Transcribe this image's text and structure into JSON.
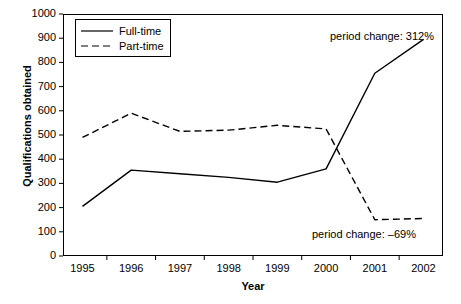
{
  "chart_data": {
    "type": "line",
    "title": "",
    "xlabel": "Year",
    "ylabel": "Qualifications obtained",
    "categories": [
      "1995",
      "1996",
      "1997",
      "1998",
      "1999",
      "2000",
      "2001",
      "2002"
    ],
    "x": [
      1995,
      1996,
      1997,
      1998,
      1999,
      2000,
      2001,
      2002
    ],
    "xlim": [
      1994.6,
      2002.4
    ],
    "ylim": [
      0,
      1000
    ],
    "yticks": [
      0,
      100,
      200,
      300,
      400,
      500,
      600,
      700,
      800,
      900,
      1000
    ],
    "ytick_labels": [
      "0",
      "100",
      "200",
      "300",
      "400",
      "500",
      "600",
      "700",
      "800",
      "900",
      "1000"
    ],
    "grid": false,
    "legend_position": "top-left",
    "series": [
      {
        "name": "Full-time",
        "style": "solid",
        "color": "#000000",
        "values": [
          205,
          355,
          340,
          325,
          305,
          360,
          755,
          895
        ]
      },
      {
        "name": "Part-time",
        "style": "dashed",
        "color": "#000000",
        "values": [
          490,
          590,
          515,
          520,
          540,
          525,
          150,
          155
        ]
      }
    ],
    "annotations": [
      {
        "text": "period change: 312%",
        "series": "Full-time"
      },
      {
        "text": "period change: –69%",
        "series": "Part-time"
      }
    ]
  },
  "legend": {
    "entries": [
      {
        "label": "Full-time"
      },
      {
        "label": "Part-time"
      }
    ]
  },
  "axes": {
    "x_title": "Year",
    "y_title": "Qualifications obtained"
  }
}
